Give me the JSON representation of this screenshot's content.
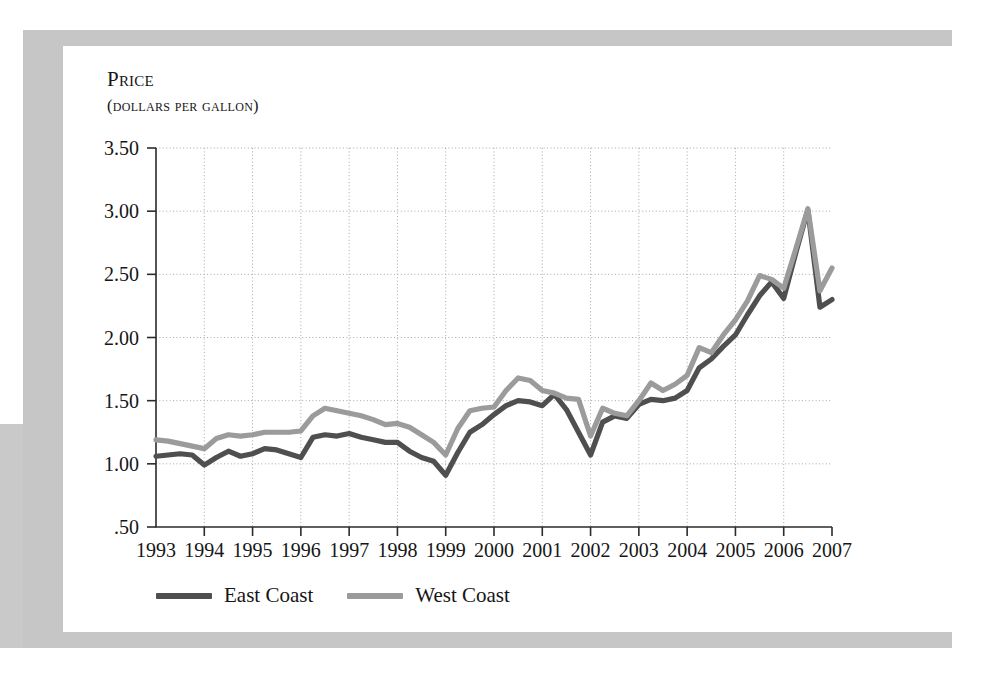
{
  "figure": {
    "axis_title_line1": "Price",
    "axis_title_line2": "(dollars per gallon)"
  },
  "legend": {
    "position": "bottom-left",
    "items": [
      {
        "label": "East Coast",
        "color": "#4f4f4f",
        "swatch_icon": "line-swatch-icon"
      },
      {
        "label": "West Coast",
        "color": "#9b9b9b",
        "swatch_icon": "line-swatch-icon"
      }
    ]
  },
  "colors": {
    "east_coast": "#4f4f4f",
    "west_coast": "#9b9b9b",
    "axis": "#2b2b2b",
    "gridline": "#a8a8a8",
    "frame": "#c6c6c6",
    "page": "#ffffff",
    "text": "#161616"
  },
  "chart_data": {
    "type": "line",
    "title": "Price (dollars per gallon)",
    "xlabel": "",
    "ylabel": "Price (dollars per gallon)",
    "xlim": [
      1993,
      2007
    ],
    "ylim": [
      0.5,
      3.5
    ],
    "yticks": [
      0.5,
      1.0,
      1.5,
      2.0,
      2.5,
      3.0,
      3.5
    ],
    "ytick_labels": [
      ".50",
      "1.00",
      "1.50",
      "2.00",
      "2.50",
      "3.00",
      "3.50"
    ],
    "xticks": [
      1993,
      1994,
      1995,
      1996,
      1997,
      1998,
      1999,
      2000,
      2001,
      2002,
      2003,
      2004,
      2005,
      2006,
      2007
    ],
    "xtick_labels": [
      "1993",
      "1994",
      "1995",
      "1996",
      "1997",
      "1998",
      "1999",
      "2000",
      "2001",
      "2002",
      "2003",
      "2004",
      "2005",
      "2006",
      "2007"
    ],
    "grid": "dotted-both-axes",
    "legend_position": "below-axes-left",
    "x": [
      1993.0,
      1993.25,
      1993.5,
      1993.75,
      1994.0,
      1994.25,
      1994.5,
      1994.75,
      1995.0,
      1995.25,
      1995.5,
      1995.75,
      1996.0,
      1996.25,
      1996.5,
      1996.75,
      1997.0,
      1997.25,
      1997.5,
      1997.75,
      1998.0,
      1998.25,
      1998.5,
      1998.75,
      1999.0,
      1999.25,
      1999.5,
      1999.75,
      2000.0,
      2000.25,
      2000.5,
      2000.75,
      2001.0,
      2001.25,
      2001.5,
      2001.75,
      2002.0,
      2002.25,
      2002.5,
      2002.75,
      2003.0,
      2003.25,
      2003.5,
      2003.75,
      2004.0,
      2004.25,
      2004.5,
      2004.75,
      2005.0,
      2005.25,
      2005.5,
      2005.75,
      2006.0,
      2006.25,
      2006.5,
      2006.75,
      2007.0
    ],
    "series": [
      {
        "name": "East Coast",
        "color": "#4f4f4f",
        "values": [
          1.06,
          1.07,
          1.08,
          1.07,
          0.99,
          1.05,
          1.1,
          1.06,
          1.08,
          1.12,
          1.11,
          1.08,
          1.05,
          1.21,
          1.23,
          1.22,
          1.24,
          1.21,
          1.19,
          1.17,
          1.17,
          1.1,
          1.05,
          1.02,
          0.91,
          1.09,
          1.25,
          1.31,
          1.39,
          1.46,
          1.5,
          1.49,
          1.46,
          1.55,
          1.43,
          1.25,
          1.07,
          1.33,
          1.38,
          1.36,
          1.47,
          1.51,
          1.5,
          1.52,
          1.58,
          1.76,
          1.83,
          1.93,
          2.02,
          2.18,
          2.33,
          2.44,
          2.31,
          2.67,
          3.01,
          2.24,
          2.3
        ]
      },
      {
        "name": "West Coast",
        "color": "#9b9b9b",
        "values": [
          1.19,
          1.18,
          1.16,
          1.14,
          1.12,
          1.2,
          1.23,
          1.22,
          1.23,
          1.25,
          1.25,
          1.25,
          1.26,
          1.38,
          1.44,
          1.42,
          1.4,
          1.38,
          1.35,
          1.31,
          1.32,
          1.29,
          1.23,
          1.17,
          1.07,
          1.28,
          1.42,
          1.44,
          1.45,
          1.58,
          1.68,
          1.66,
          1.58,
          1.56,
          1.52,
          1.51,
          1.22,
          1.44,
          1.4,
          1.38,
          1.5,
          1.64,
          1.58,
          1.63,
          1.7,
          1.92,
          1.88,
          2.02,
          2.14,
          2.29,
          2.49,
          2.46,
          2.39,
          2.7,
          3.02,
          2.37,
          2.55
        ]
      }
    ]
  }
}
